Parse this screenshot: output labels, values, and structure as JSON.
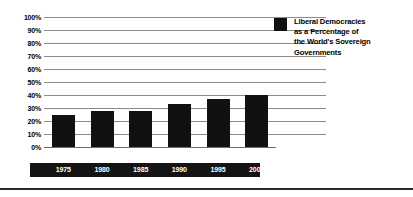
{
  "chart_data": {
    "type": "bar",
    "title": "",
    "xlabel": "",
    "ylabel": "",
    "categories": [
      "1975",
      "1980",
      "1985",
      "1990",
      "1995",
      "2000"
    ],
    "values": [
      25,
      28,
      28,
      33,
      37,
      40
    ],
    "ylim": [
      0,
      100
    ],
    "y_ticks": [
      100,
      90,
      80,
      70,
      60,
      50,
      40,
      30,
      20,
      10,
      0
    ],
    "y_tick_labels": [
      "100%",
      "90%",
      "80%",
      "70%",
      "60%",
      "50%",
      "40%",
      "30%",
      "20%",
      "10%",
      "0%"
    ],
    "grid": true,
    "legend_position": "right",
    "series": [
      {
        "name": "Liberal Democracies as a Percentage of the World's Sovereign Governments",
        "color": "#111111",
        "values": [
          25,
          28,
          28,
          33,
          37,
          40
        ]
      }
    ]
  },
  "legend": {
    "swatch_color": "#111111",
    "lines": [
      "Liberal Democracies",
      "as a Percentage of",
      "the World's Sovereign",
      "Governments"
    ]
  },
  "colors": {
    "bar": "#111111",
    "gridline": "#8b8b8b",
    "axis_band": "#141414",
    "axis_band_text": "#ffffff",
    "rule": "#2b2b2b",
    "background": "#ffffff"
  }
}
